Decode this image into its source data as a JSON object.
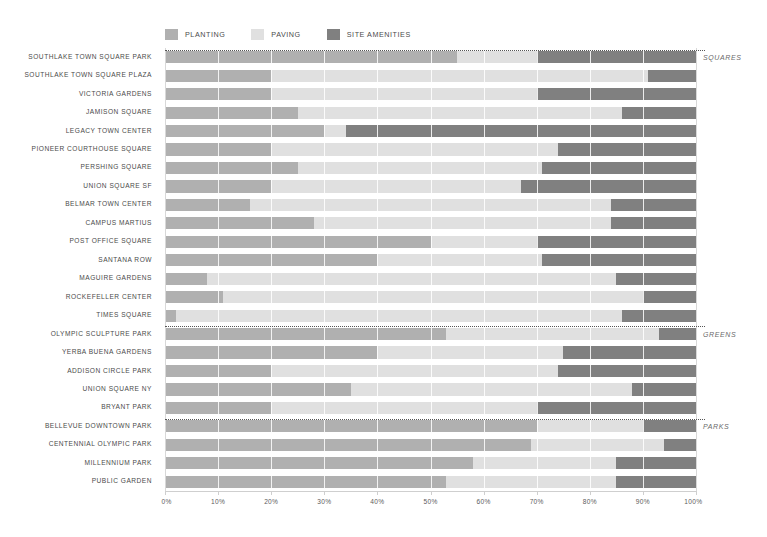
{
  "chart_data": {
    "type": "bar",
    "subtype": "stacked-horizontal-100-percent",
    "title": "",
    "xlabel": "",
    "ylabel": "",
    "xlim": [
      0,
      100
    ],
    "xunit": "%",
    "grid": true,
    "legend_position": "top",
    "series": [
      {
        "name": "PLANTING",
        "color": "#b0b0b0"
      },
      {
        "name": "PAVING",
        "color": "#e0e0e0"
      },
      {
        "name": "SITE AMENITIES",
        "color": "#808080"
      }
    ],
    "xticks": [
      0,
      10,
      20,
      30,
      40,
      50,
      60,
      70,
      80,
      90,
      100
    ],
    "xticklabels": [
      "0%",
      "10%",
      "20%",
      "30%",
      "40%",
      "50%",
      "60%",
      "70%",
      "80%",
      "90%",
      "100%"
    ],
    "groups": [
      {
        "label": "SQUARES",
        "categories": [
          "SOUTHLAKE TOWN SQUARE PARK",
          "SOUTHLAKE TOWN SQUARE PLAZA",
          "VICTORIA GARDENS",
          "JAMISON SQUARE",
          "LEGACY TOWN CENTER",
          "PIONEER COURTHOUSE SQUARE",
          "PERSHING SQUARE",
          "UNION SQUARE SF",
          "BELMAR TOWN CENTER",
          "CAMPUS MARTIUS",
          "POST OFFICE SQUARE",
          "SANTANA ROW",
          "MAGUIRE GARDENS",
          "ROCKEFELLER CENTER",
          "TIMES SQUARE"
        ],
        "values": [
          [
            55,
            15,
            30
          ],
          [
            20,
            71,
            9
          ],
          [
            20,
            50,
            30
          ],
          [
            25,
            61,
            14
          ],
          [
            30,
            4,
            66
          ],
          [
            20,
            54,
            26
          ],
          [
            25,
            46,
            29
          ],
          [
            20,
            47,
            33
          ],
          [
            16,
            68,
            16
          ],
          [
            28,
            56,
            16
          ],
          [
            50,
            20,
            30
          ],
          [
            40,
            31,
            29
          ],
          [
            8,
            77,
            15
          ],
          [
            11,
            79,
            10
          ],
          [
            2,
            84,
            14
          ]
        ]
      },
      {
        "label": "GREENS",
        "categories": [
          "OLYMPIC SCULPTURE PARK",
          "YERBA BUENA GARDENS",
          "ADDISON CIRCLE PARK",
          "UNION SQUARE NY",
          "BRYANT PARK"
        ],
        "values": [
          [
            53,
            40,
            7
          ],
          [
            40,
            35,
            25
          ],
          [
            20,
            54,
            26
          ],
          [
            35,
            53,
            12
          ],
          [
            20,
            50,
            30
          ]
        ]
      },
      {
        "label": "PARKS",
        "categories": [
          "BELLEVUE DOWNTOWN PARK",
          "CENTENNIAL OLYMPIC PARK",
          "MILLENNIUM PARK",
          "PUBLIC GARDEN"
        ],
        "values": [
          [
            70,
            20,
            10
          ],
          [
            69,
            25,
            6
          ],
          [
            58,
            27,
            15
          ],
          [
            53,
            32,
            15
          ]
        ]
      }
    ]
  },
  "legend": {
    "items": [
      {
        "label": "PLANTING",
        "color": "#b0b0b0"
      },
      {
        "label": "PAVING",
        "color": "#e0e0e0"
      },
      {
        "label": "SITE AMENITIES",
        "color": "#808080"
      }
    ]
  },
  "colors": {
    "planting": "#b0b0b0",
    "paving": "#e0e0e0",
    "site_amenities": "#808080",
    "text": "#4a4a4a",
    "group_text": "#6a6a6a",
    "axis": "#cfcfcf",
    "background": "#ffffff"
  }
}
